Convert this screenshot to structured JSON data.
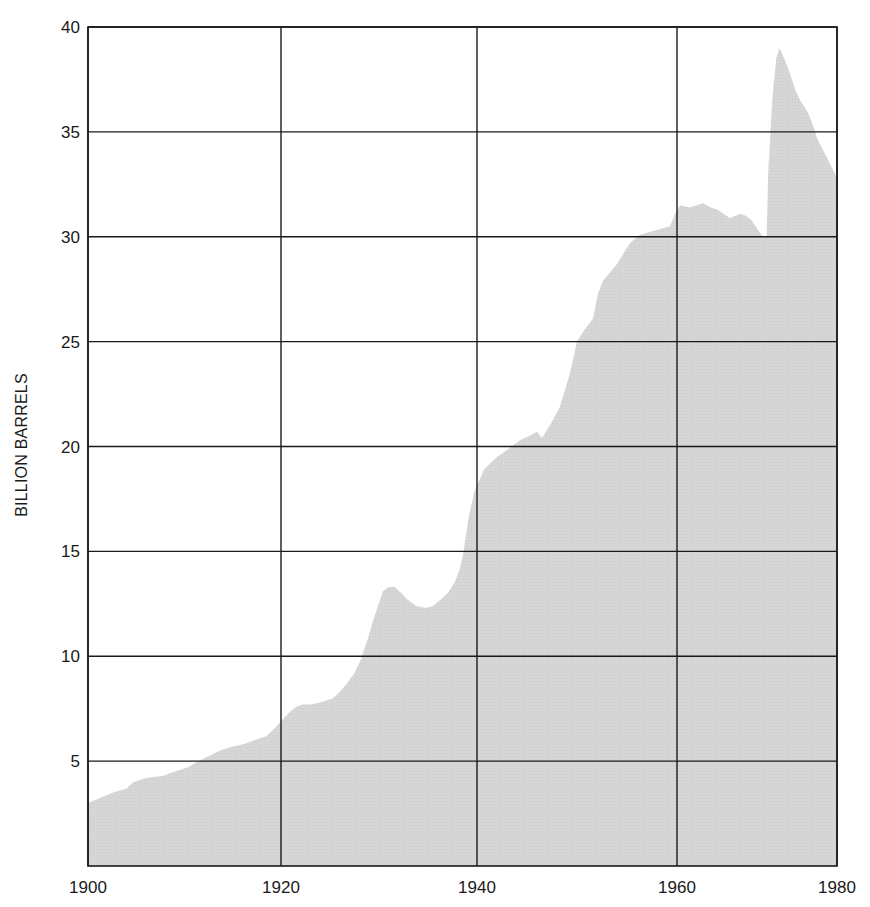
{
  "chart_data": {
    "type": "area",
    "title": "",
    "xlabel": "",
    "ylabel": "BILLION BARRELS",
    "xlim": [
      1900,
      1980
    ],
    "ylim": [
      0,
      40
    ],
    "grid": true,
    "legend": null,
    "x_ticks": [
      1900,
      1920,
      1940,
      1960,
      1980
    ],
    "x_tick_labels": [
      "1900",
      "1920",
      "1940",
      "1960",
      "1980"
    ],
    "y_ticks": [
      5,
      10,
      15,
      20,
      25,
      30,
      35,
      40
    ],
    "y_tick_labels": [
      "5",
      "10",
      "15",
      "20",
      "25",
      "30",
      "35",
      "40"
    ],
    "fill_color": "#d5d5d5",
    "grid_color": "#1a1a1a",
    "series": [
      {
        "name": "Billion barrels",
        "points": [
          [
            1900.0,
            3.0
          ],
          [
            1901.0,
            3.2
          ],
          [
            1902.6,
            3.5
          ],
          [
            1904.0,
            3.7
          ],
          [
            1904.7,
            4.0
          ],
          [
            1906.0,
            4.2
          ],
          [
            1907.8,
            4.3
          ],
          [
            1909.0,
            4.5
          ],
          [
            1910.3,
            4.7
          ],
          [
            1911.9,
            5.1
          ],
          [
            1913.7,
            5.5
          ],
          [
            1915.0,
            5.7
          ],
          [
            1916.1,
            5.8
          ],
          [
            1917.3,
            6.0
          ],
          [
            1918.5,
            6.2
          ],
          [
            1919.2,
            6.5
          ],
          [
            1920.0,
            6.9
          ],
          [
            1920.8,
            7.3
          ],
          [
            1921.6,
            7.6
          ],
          [
            1922.2,
            7.7
          ],
          [
            1923.0,
            7.7
          ],
          [
            1924.0,
            7.8
          ],
          [
            1925.3,
            8.0
          ],
          [
            1926.0,
            8.3
          ],
          [
            1926.7,
            8.7
          ],
          [
            1927.5,
            9.2
          ],
          [
            1928.1,
            9.8
          ],
          [
            1928.9,
            10.9
          ],
          [
            1929.4,
            11.7
          ],
          [
            1929.9,
            12.4
          ],
          [
            1930.4,
            13.1
          ],
          [
            1931.0,
            13.3
          ],
          [
            1931.6,
            13.3
          ],
          [
            1932.3,
            13.0
          ],
          [
            1932.9,
            12.7
          ],
          [
            1933.8,
            12.4
          ],
          [
            1934.8,
            12.3
          ],
          [
            1935.5,
            12.4
          ],
          [
            1936.3,
            12.7
          ],
          [
            1937.0,
            13.0
          ],
          [
            1937.7,
            13.5
          ],
          [
            1938.2,
            14.1
          ],
          [
            1938.6,
            14.9
          ],
          [
            1939.1,
            16.5
          ],
          [
            1939.7,
            17.8
          ],
          [
            1940.7,
            18.9
          ],
          [
            1942.0,
            19.5
          ],
          [
            1943.2,
            19.9
          ],
          [
            1944.3,
            20.3
          ],
          [
            1945.2,
            20.5
          ],
          [
            1946.0,
            20.7
          ],
          [
            1946.5,
            20.4
          ],
          [
            1947.4,
            21.1
          ],
          [
            1948.3,
            21.9
          ],
          [
            1949.3,
            23.5
          ],
          [
            1950.0,
            25.0
          ],
          [
            1950.8,
            25.6
          ],
          [
            1951.6,
            26.1
          ],
          [
            1952.1,
            27.3
          ],
          [
            1952.6,
            27.9
          ],
          [
            1953.3,
            28.3
          ],
          [
            1954.0,
            28.7
          ],
          [
            1955.3,
            29.7
          ],
          [
            1956.3,
            30.1
          ],
          [
            1957.8,
            30.3
          ],
          [
            1959.3,
            30.5
          ],
          [
            1959.8,
            31.1
          ],
          [
            1960.4,
            31.5
          ],
          [
            1961.6,
            31.4
          ],
          [
            1962.5,
            31.5
          ],
          [
            1963.3,
            31.6
          ],
          [
            1964.2,
            31.4
          ],
          [
            1965.0,
            31.3
          ],
          [
            1965.8,
            31.1
          ],
          [
            1966.6,
            30.9
          ],
          [
            1967.3,
            31.0
          ],
          [
            1967.9,
            31.1
          ],
          [
            1968.6,
            31.0
          ],
          [
            1969.3,
            30.8
          ],
          [
            1970.0,
            30.4
          ],
          [
            1970.75,
            30.0
          ],
          [
            1971.2,
            30.0
          ],
          [
            1971.4,
            33.0
          ],
          [
            1971.9,
            36.5
          ],
          [
            1972.4,
            38.5
          ],
          [
            1972.8,
            39.0
          ],
          [
            1973.4,
            38.5
          ],
          [
            1974.1,
            37.8
          ],
          [
            1974.8,
            37.0
          ],
          [
            1975.4,
            36.5
          ],
          [
            1976.4,
            35.9
          ],
          [
            1977.0,
            35.3
          ],
          [
            1977.5,
            34.7
          ],
          [
            1978.3,
            34.1
          ],
          [
            1979.1,
            33.5
          ],
          [
            1980.0,
            32.8
          ]
        ]
      }
    ],
    "layout_px": {
      "plot_left": 88,
      "plot_right": 837,
      "plot_top": 27,
      "plot_bottom": 866,
      "x_tick_px": [
        88,
        281,
        477,
        677,
        837
      ]
    }
  }
}
